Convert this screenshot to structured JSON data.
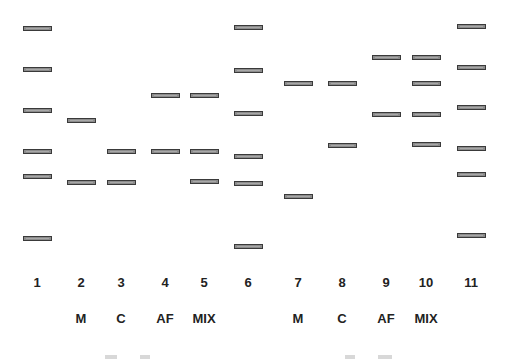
{
  "figure": {
    "type": "gel_electrophoresis_diagram",
    "band_color": "#8c8c8c",
    "band_border": "#3a3a3a",
    "lanes": [
      {
        "number": "1",
        "label": "",
        "x": 23,
        "bands": [
          29,
          70,
          111,
          152,
          177,
          239
        ]
      },
      {
        "number": "2",
        "label": "M",
        "x": 67,
        "bands": [
          121,
          183
        ]
      },
      {
        "number": "3",
        "label": "C",
        "x": 107,
        "bands": [
          152,
          183
        ]
      },
      {
        "number": "4",
        "label": "AF",
        "x": 151,
        "bands": [
          96,
          152
        ]
      },
      {
        "number": "5",
        "label": "MIX",
        "x": 190,
        "bands": [
          96,
          152,
          182
        ]
      },
      {
        "number": "6",
        "label": "",
        "x": 234,
        "bands": [
          28,
          71,
          114,
          157,
          184,
          247
        ]
      },
      {
        "number": "7",
        "label": "M",
        "x": 284,
        "bands": [
          84,
          197
        ]
      },
      {
        "number": "8",
        "label": "C",
        "x": 328,
        "bands": [
          84,
          146
        ]
      },
      {
        "number": "9",
        "label": "AF",
        "x": 372,
        "bands": [
          58,
          115
        ]
      },
      {
        "number": "10",
        "label": "MIX",
        "x": 412,
        "bands": [
          58,
          84,
          115,
          145
        ]
      },
      {
        "number": "11",
        "label": "",
        "x": 457,
        "bands": [
          27,
          68,
          108,
          149,
          175,
          236
        ]
      }
    ]
  }
}
